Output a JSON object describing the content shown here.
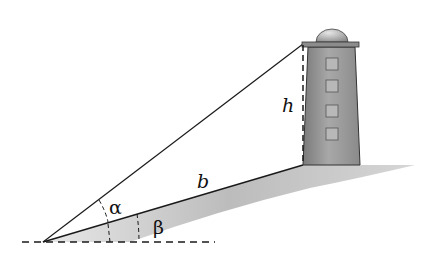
{
  "diagram": {
    "labels": {
      "height": "h",
      "slope_distance": "b",
      "angle_alpha": "α",
      "angle_beta": "β"
    },
    "colors": {
      "line": "#1a1a1a",
      "tower_fill": "#9a9a9a",
      "ground_shadow": "#bdbdbd",
      "background": "#ffffff"
    },
    "lighthouse": {
      "window_count": 4
    }
  }
}
